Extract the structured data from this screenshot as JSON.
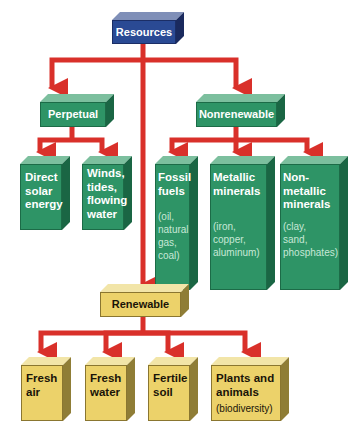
{
  "diagram": {
    "root": {
      "label": "Resources",
      "color": "#2a4a94"
    },
    "perpetual": {
      "label": "Perpetual",
      "color": "#2e9466",
      "children": [
        {
          "label": "Direct solar energy",
          "lines": [
            "Direct",
            "solar",
            "energy"
          ]
        },
        {
          "label": "Winds, tides, flowing water",
          "lines": [
            "Winds,",
            "tides,",
            "flowing",
            "water"
          ]
        }
      ]
    },
    "nonrenewable": {
      "label": "Nonrenewable",
      "color": "#2e9466",
      "children": [
        {
          "label": "Fossil fuels",
          "lines": [
            "Fossil",
            "fuels"
          ],
          "examples": [
            "(oil,",
            "natural",
            "gas,",
            "coal)"
          ]
        },
        {
          "label": "Metallic minerals",
          "lines": [
            "Metallic",
            "minerals"
          ],
          "examples": [
            "(iron,",
            "copper,",
            "aluminum)"
          ]
        },
        {
          "label": "Nonmetallic minerals",
          "lines": [
            "Non-",
            "metallic",
            "minerals"
          ],
          "examples": [
            "(clay,",
            "sand,",
            "phosphates)"
          ]
        }
      ]
    },
    "renewable": {
      "label": "Renewable",
      "color": "#ecd26a",
      "children": [
        {
          "label": "Fresh air",
          "lines": [
            "Fresh",
            "air"
          ]
        },
        {
          "label": "Fresh water",
          "lines": [
            "Fresh",
            "water"
          ]
        },
        {
          "label": "Fertile soil",
          "lines": [
            "Fertile",
            "soil"
          ]
        },
        {
          "label": "Plants and animals",
          "lines": [
            "Plants and",
            "animals"
          ],
          "examples": [
            "(biodiversity)"
          ]
        }
      ]
    },
    "connector_color": "#d9302a"
  }
}
